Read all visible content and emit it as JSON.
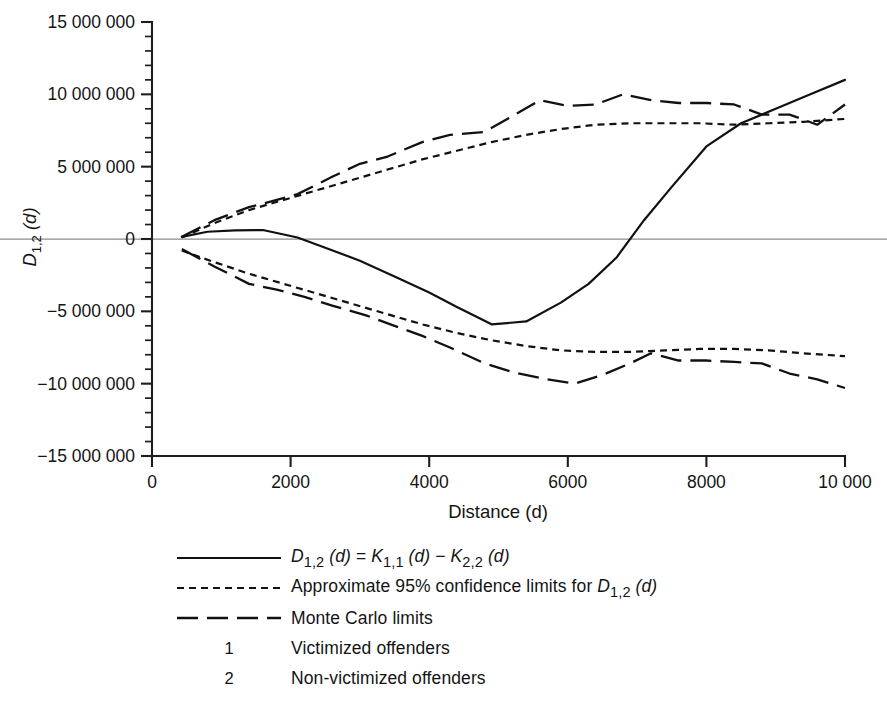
{
  "chart_data": {
    "type": "line",
    "title": "",
    "xlabel": "Distance (d)",
    "ylabel": "D1,2 (d)",
    "xlim": [
      0,
      10000
    ],
    "ylim": [
      -15000000,
      15000000
    ],
    "grid": false,
    "legend_position": "below-center",
    "x_ticks": [
      {
        "value": 0,
        "label": "0"
      },
      {
        "value": 2000,
        "label": "2000"
      },
      {
        "value": 4000,
        "label": "4000"
      },
      {
        "value": 6000,
        "label": "6000"
      },
      {
        "value": 8000,
        "label": "8000"
      },
      {
        "value": 10000,
        "label": "10 000"
      }
    ],
    "y_ticks": [
      {
        "value": 15000000,
        "label": "15 000 000"
      },
      {
        "value": 10000000,
        "label": "10 000 000"
      },
      {
        "value": 5000000,
        "label": "5 000 000"
      },
      {
        "value": 0,
        "label": "0"
      },
      {
        "value": -5000000,
        "label": "−5 000 000"
      },
      {
        "value": -10000000,
        "label": "−10 000 000"
      },
      {
        "value": -15000000,
        "label": "−15 000 000"
      }
    ],
    "y_minor_step": 1000000,
    "reference_lines": [
      {
        "y": 0,
        "style": "thin-gray"
      }
    ],
    "series": [
      {
        "name": "D_1,2 (d) = K_1,1 (d) - K_2,2 (d)",
        "style": "solid",
        "x": [
          430,
          800,
          1200,
          1600,
          2100,
          2500,
          3000,
          3500,
          4000,
          4400,
          4900,
          5400,
          5900,
          6300,
          6700,
          7100,
          7500,
          8000,
          8500,
          9000,
          9500,
          10000
        ],
        "y": [
          150000,
          500000,
          600000,
          620000,
          100000,
          -600000,
          -1500000,
          -2600000,
          -3700000,
          -4700000,
          -5900000,
          -5700000,
          -4400000,
          -3100000,
          -1300000,
          1300000,
          3600000,
          6400000,
          8000000,
          9000000,
          10000000,
          11000000
        ]
      },
      {
        "name": "Approximate 95% confidence limits for D_1,2 (d) (upper)",
        "style": "dotted",
        "x": [
          430,
          900,
          1400,
          1900,
          2400,
          2900,
          3400,
          3900,
          4400,
          4900,
          5400,
          5900,
          6400,
          6900,
          7400,
          7900,
          8400,
          8900,
          9400,
          10000
        ],
        "y": [
          100000,
          1100000,
          2000000,
          2700000,
          3400000,
          4100000,
          4800000,
          5500000,
          6100000,
          6700000,
          7200000,
          7600000,
          7900000,
          8000000,
          8000000,
          8000000,
          7900000,
          8000000,
          8100000,
          8300000
        ]
      },
      {
        "name": "Approximate 95% confidence limits for D_1,2 (d) (lower)",
        "style": "dotted",
        "x": [
          430,
          900,
          1400,
          1900,
          2400,
          2900,
          3400,
          3900,
          4400,
          4900,
          5400,
          5900,
          6400,
          6900,
          7400,
          7900,
          8400,
          8900,
          9400,
          10000
        ],
        "y": [
          -800000,
          -1600000,
          -2400000,
          -3100000,
          -3800000,
          -4500000,
          -5200000,
          -5900000,
          -6500000,
          -7000000,
          -7400000,
          -7700000,
          -7800000,
          -7800000,
          -7700000,
          -7600000,
          -7600000,
          -7700000,
          -7900000,
          -8100000
        ]
      },
      {
        "name": "Monte Carlo limits (upper)",
        "style": "dashed",
        "x": [
          430,
          900,
          1400,
          1800,
          2100,
          2600,
          3000,
          3400,
          3900,
          4300,
          4800,
          5200,
          5600,
          6000,
          6400,
          6800,
          7200,
          7600,
          8000,
          8400,
          8800,
          9200,
          9600,
          10000
        ],
        "y": [
          150000,
          1300000,
          2200000,
          2700000,
          3100000,
          4300000,
          5200000,
          5700000,
          6700000,
          7200000,
          7400000,
          8500000,
          9600000,
          9200000,
          9300000,
          10000000,
          9600000,
          9400000,
          9400000,
          9300000,
          8600000,
          8600000,
          7900000,
          9300000
        ]
      },
      {
        "name": "Monte Carlo limits (lower)",
        "style": "dashed",
        "x": [
          430,
          900,
          1400,
          1800,
          2200,
          2600,
          3100,
          3500,
          3900,
          4300,
          4800,
          5200,
          5700,
          6100,
          6500,
          6900,
          7200,
          7600,
          8000,
          8400,
          8800,
          9200,
          9600,
          10000
        ],
        "y": [
          -700000,
          -1900000,
          -3100000,
          -3500000,
          -4000000,
          -4600000,
          -5300000,
          -6000000,
          -6700000,
          -7500000,
          -8600000,
          -9200000,
          -9700000,
          -10000000,
          -9400000,
          -8600000,
          -7900000,
          -8400000,
          -8400000,
          -8500000,
          -8600000,
          -9300000,
          -9700000,
          -10300000
        ]
      }
    ]
  },
  "legend": {
    "rows": [
      {
        "key": "solid",
        "label": "",
        "rich": "solid-formula"
      },
      {
        "key": "dotted",
        "label": "",
        "rich": "confidence"
      },
      {
        "key": "dashed",
        "label": "Monte Carlo limits"
      },
      {
        "key": "number",
        "number": "1",
        "label": "Victimized offenders"
      },
      {
        "key": "number",
        "number": "2",
        "label": "Non-victimized offenders"
      }
    ],
    "formula": {
      "d_main": "D",
      "d_main_sub": "1,2",
      "arg1": "(d)",
      "equals": "=",
      "k1": "K",
      "k1_sub": "1,1",
      "arg2": "(d)",
      "minus": "−",
      "k2": "K",
      "k2_sub": "2,2",
      "arg3": "(d)"
    },
    "confidence": {
      "prefix": "Approximate 95% confidence limits for",
      "d_main": "D",
      "d_main_sub": "1,2",
      "arg": "(d)"
    },
    "monte_carlo_label": "Monte Carlo limits"
  },
  "axes": {
    "x_title": "Distance (d)",
    "y_title_main": "D",
    "y_title_sub": "1,2",
    "y_title_arg": "(d)"
  },
  "colors": {
    "ink": "#111111",
    "axis": "#1d1d1d",
    "zero_line": "#8c8c8c",
    "background": "#ffffff"
  }
}
